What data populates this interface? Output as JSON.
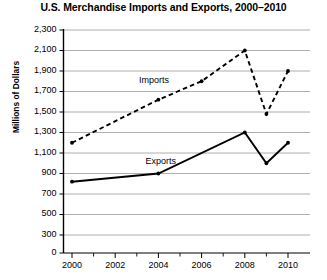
{
  "chart_data": {
    "type": "line",
    "title": "U.S. Merchandise Imports and Exports, 2000–2010",
    "xlabel": "",
    "ylabel": "Millions of Dollars",
    "x": [
      2000,
      2001,
      2002,
      2003,
      2004,
      2005,
      2006,
      2007,
      2008,
      2009,
      2010
    ],
    "xlim": [
      2000,
      2010
    ],
    "ylim": [
      0,
      2300
    ],
    "xticks": [
      2000,
      2002,
      2004,
      2006,
      2008,
      2010
    ],
    "xtick_labels": [
      "2000",
      "2002",
      "2004",
      "2006",
      "2008",
      "2010"
    ],
    "xminor_ticks": [
      2001,
      2003,
      2005,
      2007,
      2009
    ],
    "yticks": [
      0,
      300,
      500,
      700,
      900,
      1100,
      1300,
      1500,
      1700,
      1900,
      2100,
      2300
    ],
    "ytick_labels": [
      "0",
      "300",
      "500",
      "700",
      "900",
      "1,100",
      "1,300",
      "1,500",
      "1,700",
      "1,900",
      "2,100",
      "2,300"
    ],
    "grid": true,
    "axis_break": true,
    "legend_position": "inline-annotation",
    "series": [
      {
        "name": "Imports",
        "style": "dashed",
        "color": "#000000",
        "label_x": 2003.1,
        "label_y": 1800,
        "points": [
          {
            "x": 2000,
            "y": 1200
          },
          {
            "x": 2004,
            "y": 1620
          },
          {
            "x": 2006,
            "y": 1800
          },
          {
            "x": 2008,
            "y": 2100
          },
          {
            "x": 2009,
            "y": 1480
          },
          {
            "x": 2010,
            "y": 1900
          }
        ]
      },
      {
        "name": "Exports",
        "style": "solid",
        "color": "#000000",
        "label_x": 2003.4,
        "label_y": 1010,
        "points": [
          {
            "x": 2000,
            "y": 820
          },
          {
            "x": 2004,
            "y": 900
          },
          {
            "x": 2008,
            "y": 1300
          },
          {
            "x": 2009,
            "y": 1000
          },
          {
            "x": 2010,
            "y": 1200
          }
        ]
      }
    ]
  }
}
